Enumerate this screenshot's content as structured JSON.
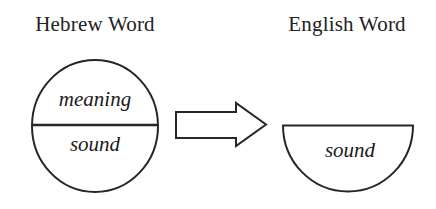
{
  "diagram": {
    "type": "concept-diagram",
    "background_color": "#ffffff",
    "stroke_color": "#262626",
    "headings": {
      "left": "Hebrew Word",
      "right": "English Word"
    },
    "left_shape": {
      "shape": "circle",
      "divided": true,
      "upper_label": "meaning",
      "lower_label": "sound"
    },
    "connector": {
      "shape": "block-arrow",
      "direction": "right",
      "filled": false
    },
    "right_shape": {
      "shape": "half-circle",
      "orientation": "flat-top",
      "label": "sound"
    }
  }
}
